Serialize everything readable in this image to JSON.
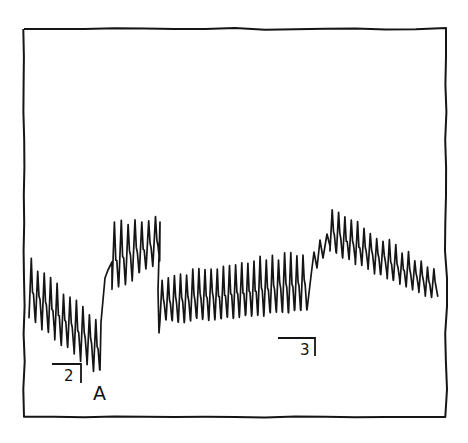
{
  "figure": {
    "style": "hand-drawn physiological recording trace",
    "ink_color": "#151515",
    "background": "#ffffff",
    "frame": {
      "left": 24,
      "top": 29,
      "right": 446,
      "bottom": 417
    },
    "annotations": [
      {
        "id": "marker-2",
        "text": "2",
        "x": 64,
        "y": 381,
        "bar_x1": 52,
        "bar_x2": 81,
        "bar_y": 364,
        "tick_y2": 383
      },
      {
        "id": "marker-3",
        "text": "3",
        "x": 300,
        "y": 355,
        "bar_x1": 278,
        "bar_x2": 315,
        "bar_y": 338,
        "tick_y2": 356
      },
      {
        "id": "label-A",
        "text": "A",
        "x": 100,
        "y": 400
      }
    ],
    "labels": {
      "marker2": "2",
      "marker3": "3",
      "pointA": "A"
    }
  },
  "trace": {
    "segments": [
      {
        "name": "baseline-declining",
        "x_start": 29,
        "x_end": 100,
        "cycles": 11,
        "top_start": 262,
        "top_end": 320,
        "bottom_start": 318,
        "bottom_end": 370
      },
      {
        "name": "rise-after-A",
        "x_start": 100,
        "x_end": 112,
        "points": [
          [
            100,
            370
          ],
          [
            101,
            322
          ],
          [
            103,
            300
          ],
          [
            105,
            278
          ],
          [
            108,
            270
          ],
          [
            112,
            262
          ]
        ]
      },
      {
        "name": "elevated-plateau",
        "x_start": 112,
        "x_end": 160,
        "cycles": 7,
        "top_start": 225,
        "top_end": 220,
        "bottom_start": 288,
        "bottom_end": 262
      },
      {
        "name": "drop",
        "x_start": 160,
        "x_end": 160,
        "points": [
          [
            160,
            222
          ],
          [
            158,
            290
          ],
          [
            159,
            333
          ]
        ]
      },
      {
        "name": "slow-rise",
        "x_start": 160,
        "x_end": 307,
        "cycles": 24,
        "top_start": 278,
        "top_end": 252,
        "bottom_start": 322,
        "bottom_end": 310
      },
      {
        "name": "step-up",
        "x_start": 307,
        "x_end": 330,
        "points": [
          [
            307,
            310
          ],
          [
            311,
            276
          ],
          [
            314,
            252
          ],
          [
            317,
            268
          ],
          [
            320,
            240
          ],
          [
            323,
            258
          ],
          [
            327,
            234
          ],
          [
            330,
            246
          ]
        ]
      },
      {
        "name": "peak-and-decline",
        "x_start": 330,
        "x_end": 438,
        "cycles": 17,
        "top_start": 210,
        "top_end": 268,
        "bottom_start": 252,
        "bottom_end": 298
      }
    ]
  }
}
